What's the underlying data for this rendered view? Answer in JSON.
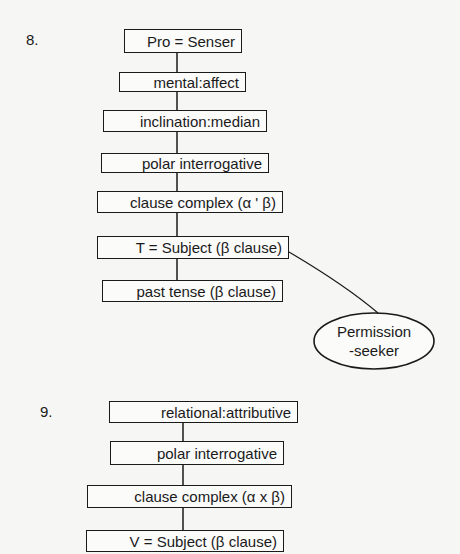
{
  "diagrams": [
    {
      "number": "8.",
      "nodes": [
        "Pro = Senser",
        "mental:affect",
        "inclination:median",
        "polar interrogative",
        "clause complex (α ' β)",
        "T = Subject (β  clause)",
        "past tense (β clause)"
      ],
      "callout": {
        "attached_to": "T = Subject (β  clause)",
        "line1": "Permission",
        "line2": "-seeker"
      }
    },
    {
      "number": "9.",
      "nodes": [
        "relational:attributive",
        "polar interrogative",
        "clause complex (α x β)",
        "V = Subject (β clause)"
      ]
    }
  ],
  "colors": {
    "background": "#f6f6f4",
    "ink": "#1a1a1a"
  }
}
